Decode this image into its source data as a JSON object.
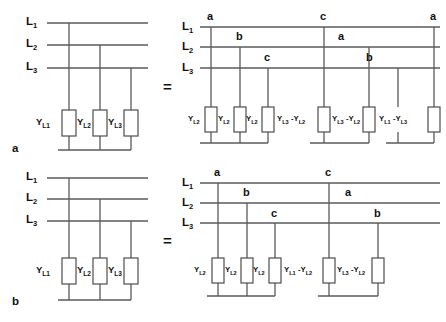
{
  "figure": {
    "title": "",
    "equals_sign": "=",
    "colors": {
      "wire": "#5a5a5a",
      "component_stroke": "#4d4d4d",
      "text": "#111111",
      "background": "#ffffff"
    }
  },
  "panels": [
    {
      "id": "a",
      "panel_label": "a",
      "left_circuit": {
        "rails": [
          {
            "name": "L",
            "subscript": "1"
          },
          {
            "name": "L",
            "subscript": "2"
          },
          {
            "name": "L",
            "subscript": "3"
          }
        ],
        "elements": [
          {
            "label": "Y",
            "subscript": "L1"
          },
          {
            "label": "Y",
            "subscript": "L2"
          },
          {
            "label": "Y",
            "subscript": "L3"
          }
        ]
      },
      "right_circuit": {
        "rails": [
          {
            "name": "L",
            "subscript": "1"
          },
          {
            "name": "L",
            "subscript": "2"
          },
          {
            "name": "L",
            "subscript": "3"
          }
        ],
        "node_letters": [
          "a",
          "b",
          "c",
          "c",
          "a",
          "b",
          "a"
        ],
        "elements": [
          {
            "text": "Y",
            "sub1": "L2",
            "minus": "",
            "text2": "",
            "sub2": ""
          },
          {
            "text": "Y",
            "sub1": "L2",
            "minus": "",
            "text2": "",
            "sub2": ""
          },
          {
            "text": "Y",
            "sub1": "L2",
            "minus": "",
            "text2": "",
            "sub2": ""
          },
          {
            "text": "Y",
            "sub1": "L3",
            "minus": " -",
            "text2": "Y",
            "sub2": "L2"
          },
          {
            "text": "Y",
            "sub1": "L3",
            "minus": " -",
            "text2": "Y",
            "sub2": "L2"
          },
          {
            "text": "Y",
            "sub1": "L1",
            "minus": " -",
            "text2": "Y",
            "sub2": "L3"
          }
        ],
        "groups": [
          3,
          2,
          2
        ]
      }
    },
    {
      "id": "b",
      "panel_label": "b",
      "left_circuit": {
        "rails": [
          {
            "name": "L",
            "subscript": "1"
          },
          {
            "name": "L",
            "subscript": "2"
          },
          {
            "name": "L",
            "subscript": "3"
          }
        ],
        "elements": [
          {
            "label": "Y",
            "subscript": "L1"
          },
          {
            "label": "Y",
            "subscript": "L2"
          },
          {
            "label": "Y",
            "subscript": "L3"
          }
        ]
      },
      "right_circuit": {
        "rails": [
          {
            "name": "L",
            "subscript": "1"
          },
          {
            "name": "L",
            "subscript": "2"
          },
          {
            "name": "L",
            "subscript": "3"
          }
        ],
        "node_letters": [
          "a",
          "b",
          "c",
          "c",
          "a",
          "b"
        ],
        "elements": [
          {
            "text": "Y",
            "sub1": "L2",
            "minus": "",
            "text2": "",
            "sub2": ""
          },
          {
            "text": "Y",
            "sub1": "L2",
            "minus": "",
            "text2": "",
            "sub2": ""
          },
          {
            "text": "Y",
            "sub1": "L2",
            "minus": "",
            "text2": "",
            "sub2": ""
          },
          {
            "text": "Y",
            "sub1": "L1",
            "minus": " -",
            "text2": "Y",
            "sub2": "L2"
          },
          {
            "text": "Y",
            "sub1": "L3",
            "minus": " -",
            "text2": "Y",
            "sub2": "L2"
          }
        ],
        "groups": [
          3,
          2
        ]
      }
    }
  ]
}
